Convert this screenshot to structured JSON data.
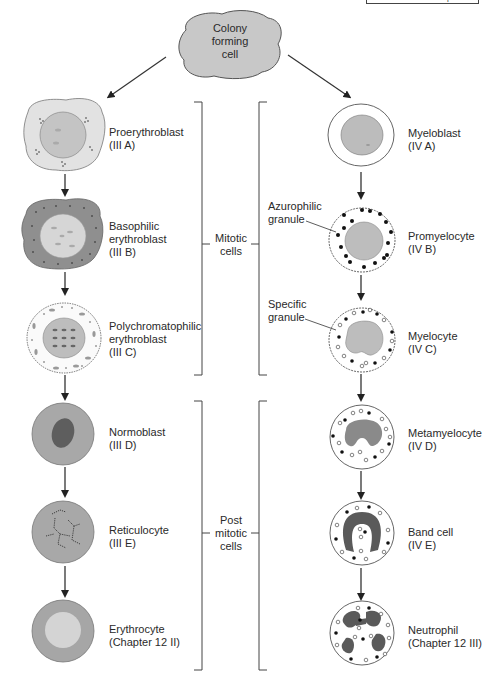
{
  "header": {
    "section": "Hematopoiesis",
    "page": ""
  },
  "origin": {
    "label_lines": [
      "Colony",
      "forming",
      "cell"
    ]
  },
  "erythroid_series": [
    {
      "name": "Proerythroblast",
      "ref": "(III A)"
    },
    {
      "name": "Basophilic",
      "name2": "erythroblast",
      "ref": "(III B)"
    },
    {
      "name": "Polychromatophilic",
      "name2": "erythroblast",
      "ref": "(III C)"
    },
    {
      "name": "Normoblast",
      "ref": "(III D)"
    },
    {
      "name": "Reticulocyte",
      "ref": "(III E)"
    },
    {
      "name": "Erythrocyte",
      "ref": "(Chapter 12 II)"
    }
  ],
  "granulocyte_series": [
    {
      "name": "Myeloblast",
      "ref": "(IV A)"
    },
    {
      "name": "Promyelocyte",
      "ref": "(IV B)"
    },
    {
      "name": "Myelocyte",
      "ref": "(IV C)"
    },
    {
      "name": "Metamyelocyte",
      "ref": "(IV D)"
    },
    {
      "name": "Band cell",
      "ref": "(IV E)"
    },
    {
      "name": "Neutrophil",
      "ref": "(Chapter 12 III)"
    }
  ],
  "annotations": {
    "azurophilic": [
      "Azurophilic",
      "granule"
    ],
    "specific": [
      "Specific",
      "granule"
    ]
  },
  "groups": {
    "mitotic": [
      "Mitotic",
      "cells"
    ],
    "post_mitotic": [
      "Post",
      "mitotic",
      "cells"
    ]
  },
  "colors": {
    "line": "#3a3a3a",
    "cytoplasm_light": "#e4e4e4",
    "cytoplasm_dark": "#8e8e8e",
    "nucleus": "#b8b8b8",
    "nucleus_dark": "#5a5a5a",
    "rbc": "#a6a6a6",
    "rbc_center": "#d2d2d2"
  }
}
